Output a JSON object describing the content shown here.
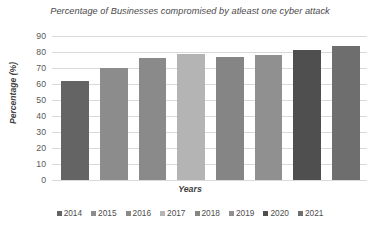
{
  "chart_data": {
    "type": "bar",
    "title": "Percentage of Businesses compromised by atleast one cyber attack",
    "xlabel": "Years",
    "ylabel": "Percentage (%)",
    "categories": [
      "2014",
      "2015",
      "2016",
      "2017",
      "2018",
      "2019",
      "2020",
      "2021"
    ],
    "values": [
      62,
      70,
      76,
      79,
      77,
      78,
      81,
      84
    ],
    "series": [
      {
        "name": "Percentage (%)",
        "values": [
          62,
          70,
          76,
          79,
          77,
          78,
          81,
          84
        ]
      }
    ],
    "ylim": [
      0,
      90
    ],
    "ytick_values": [
      90,
      80,
      70,
      60,
      50,
      40,
      30,
      20,
      10,
      0
    ],
    "ytick_labels": [
      "90",
      "80",
      "70",
      "60",
      "50",
      "40",
      "30",
      "20",
      "10",
      "0"
    ],
    "grid": true,
    "grid_axis": "y",
    "legend_position": "bottom",
    "legend_entries": [
      "2014",
      "2015",
      "2016",
      "2017",
      "2018",
      "2019",
      "2020",
      "2021"
    ],
    "bar_colors": [
      "#646464",
      "#8c8c8c",
      "#8a8a8a",
      "#b4b4b4",
      "#858585",
      "#909090",
      "#4f4f4f",
      "#6e6e6e"
    ],
    "colors": {
      "grid": "#d9d9d9",
      "axis_text": "#595959",
      "title_text": "#4a4a4a",
      "axis_title_text": "#3f3f3f",
      "background": "#ffffff"
    }
  }
}
